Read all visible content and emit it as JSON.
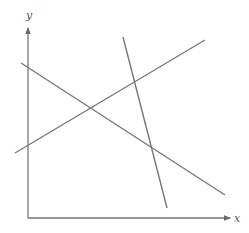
{
  "figure": {
    "type": "line-arrangement",
    "axes": {
      "x_label": "x",
      "y_label": "y",
      "origin": [
        28,
        218
      ],
      "x_end": [
        230,
        218
      ],
      "y_end": [
        28,
        28
      ]
    },
    "lines": [
      {
        "name": "line-descending",
        "from": [
          21,
          63
        ],
        "to": [
          225,
          195
        ]
      },
      {
        "name": "line-ascending",
        "from": [
          15,
          153
        ],
        "to": [
          205,
          40
        ]
      },
      {
        "name": "line-steep",
        "from": [
          123,
          37
        ],
        "to": [
          167,
          208
        ]
      }
    ],
    "colors": {
      "axis": "#777777",
      "line": "#777777",
      "label": "#555555"
    }
  }
}
